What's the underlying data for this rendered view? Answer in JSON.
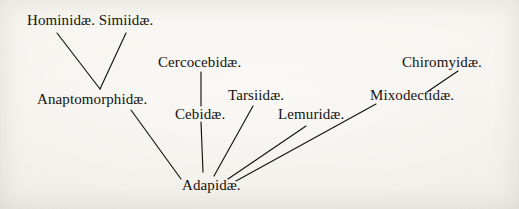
{
  "figure": {
    "kind": "phylogenetic-tree-diagram",
    "background_color": "#f4f2ed",
    "ink_color": "#15120e",
    "width": 519,
    "height": 209
  },
  "nodes": [
    {
      "id": "hominidae_simiidae",
      "label": "Hominidæ. Simiidæ.",
      "x": 27,
      "y": 13
    },
    {
      "id": "cercocebidae",
      "label": "Cercocebidæ.",
      "x": 158,
      "y": 55
    },
    {
      "id": "chiromyidae",
      "label": "Chiromyidæ.",
      "x": 402,
      "y": 55
    },
    {
      "id": "anaptomorphidae",
      "label": "Anaptomorphidæ.",
      "x": 37,
      "y": 92
    },
    {
      "id": "tarsiidae",
      "label": "Tarsiidæ.",
      "x": 228,
      "y": 88
    },
    {
      "id": "mixodectidae",
      "label": "Mixodectidæ.",
      "x": 370,
      "y": 88
    },
    {
      "id": "cebidae",
      "label": "Cebidæ.",
      "x": 175,
      "y": 107
    },
    {
      "id": "lemuridae",
      "label": "Lemuridæ.",
      "x": 278,
      "y": 107
    },
    {
      "id": "adapidae",
      "label": "Adapidæ.",
      "x": 182,
      "y": 178
    }
  ],
  "edges": [
    {
      "id": "edge-hominidae-anaptomorphidae",
      "from": "hominidae_simiidae",
      "to": "anaptomorphidae",
      "x1": 57,
      "y1": 33,
      "x2": 100,
      "y2": 89
    },
    {
      "id": "edge-simiidae-anaptomorphidae",
      "from": "hominidae_simiidae",
      "to": "anaptomorphidae",
      "x1": 126,
      "y1": 33,
      "x2": 100,
      "y2": 89
    },
    {
      "id": "edge-cercocebidae-cebidae",
      "from": "cercocebidae",
      "to": "cebidae",
      "x1": 201,
      "y1": 72,
      "x2": 201,
      "y2": 106
    },
    {
      "id": "edge-cebidae-adapidae",
      "from": "cebidae",
      "to": "adapidae",
      "x1": 201,
      "y1": 122,
      "x2": 203,
      "y2": 172
    },
    {
      "id": "edge-anaptomorphidae-adapidae",
      "from": "anaptomorphidae",
      "to": "adapidae",
      "x1": 131,
      "y1": 110,
      "x2": 181,
      "y2": 179
    },
    {
      "id": "edge-tarsiidae-adapidae",
      "from": "tarsiidae",
      "to": "adapidae",
      "x1": 253,
      "y1": 106,
      "x2": 214,
      "y2": 176
    },
    {
      "id": "edge-lemuridae-adapidae",
      "from": "lemuridae",
      "to": "adapidae",
      "x1": 306,
      "y1": 126,
      "x2": 228,
      "y2": 179
    },
    {
      "id": "edge-mixodectidae-adapidae",
      "from": "mixodectidae",
      "to": "adapidae",
      "x1": 376,
      "y1": 104,
      "x2": 236,
      "y2": 181
    },
    {
      "id": "edge-mixodectidae-chiromyidae",
      "from": "mixodectidae",
      "to": "chiromyidae",
      "x1": 427,
      "y1": 92,
      "x2": 458,
      "y2": 71
    }
  ]
}
